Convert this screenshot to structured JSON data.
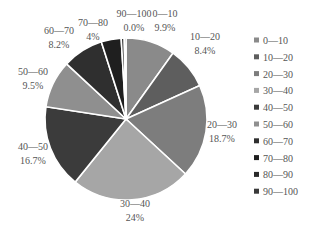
{
  "chart_data": {
    "type": "pie",
    "title": "",
    "categories": [
      "0—10",
      "10—20",
      "20—30",
      "30—40",
      "40—50",
      "50—60",
      "60—70",
      "70—80",
      "80—90",
      "90—100"
    ],
    "values": [
      9.9,
      8.4,
      18.7,
      24,
      16.7,
      9.5,
      8.2,
      4,
      0.6,
      0.0
    ],
    "data_labels": [
      "9.9%",
      "8.4%",
      "18.7%",
      "24%",
      "16.7%",
      "9.5%",
      "8.2%",
      "4%",
      "",
      "0.0%"
    ],
    "show_category_label": [
      true,
      true,
      true,
      true,
      true,
      true,
      true,
      true,
      false,
      true
    ],
    "colors": [
      "#8a8a8a",
      "#5e5e5e",
      "#7d7d7d",
      "#a6a6a6",
      "#3b3b3b",
      "#8f8f8f",
      "#2f2f2f",
      "#1f1f1f",
      "#2a2a2a",
      "#3a3a3a"
    ],
    "start_angle": "12 o'clock",
    "direction": "clockwise",
    "legend": {
      "position": "right",
      "entries": [
        "0—10",
        "10—20",
        "20—30",
        "30—40",
        "40—50",
        "50—60",
        "60—70",
        "70—80",
        "80—90",
        "90—100"
      ]
    }
  }
}
